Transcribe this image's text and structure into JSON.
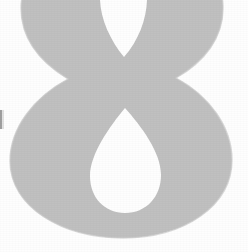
{
  "image": {
    "kind": "scanned-page-numeral",
    "description": "Large light gray numeral rendered very large, cropped at the top edge of the scan",
    "width": 248,
    "height": 252,
    "background_color": "#fefefe"
  },
  "numeral": {
    "value": "8",
    "label": "eight",
    "fill_color": "#c0c0c0",
    "outline_color": "#bdbdbd",
    "cropped_at_top": true,
    "bounds": {
      "left": 10,
      "right": 232,
      "top": -30,
      "bottom": 238
    },
    "upper_bowl": {
      "left": 20,
      "right": 223,
      "counter_left": 100,
      "counter_right": 147,
      "counter_bottom_tip_y": 58
    },
    "lower_bowl": {
      "left": 10,
      "right": 232,
      "bottom": 238,
      "counter_left": 90,
      "counter_right": 161,
      "counter_top_y": 108,
      "counter_bottom_y": 206
    },
    "waist": {
      "y": 97,
      "left_pinch_x": 60,
      "right_pinch_x": 186
    }
  },
  "artifacts": {
    "left_edge_mark": {
      "name": "scan-edge-sliver",
      "color": "#8e8e8e",
      "x": 0,
      "y": 110,
      "width": 2,
      "height": 19
    }
  }
}
